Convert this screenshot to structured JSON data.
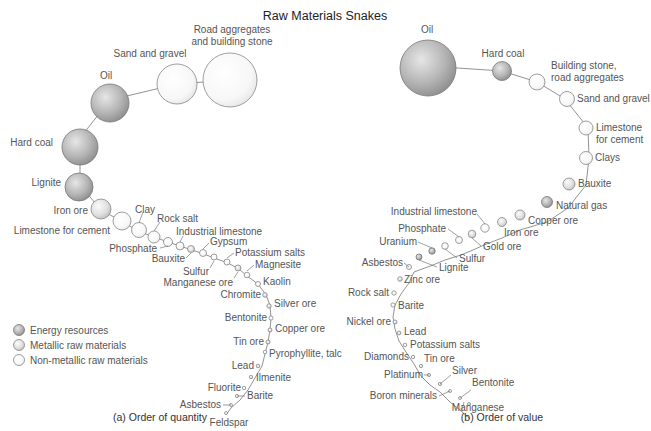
{
  "title": "Raw Materials Snakes",
  "legend": {
    "items": [
      {
        "label": "Energy resources",
        "category": "energy",
        "color": "#9a9a9a"
      },
      {
        "label": "Metallic raw materials",
        "category": "metallic",
        "color": "#d6d6d6"
      },
      {
        "label": "Non-metallic raw materials",
        "category": "nonmetallic",
        "color": "#f4f4f4"
      }
    ]
  },
  "panels": [
    {
      "caption": "(a) Order of quantity",
      "items": [
        {
          "label": "Road aggregates and building stone",
          "category": "nonmetallic"
        },
        {
          "label": "Sand and gravel",
          "category": "nonmetallic"
        },
        {
          "label": "Oil",
          "category": "energy"
        },
        {
          "label": "Hard coal",
          "category": "energy"
        },
        {
          "label": "Lignite",
          "category": "energy"
        },
        {
          "label": "Iron ore",
          "category": "metallic"
        },
        {
          "label": "Limestone for cement",
          "category": "nonmetallic"
        },
        {
          "label": "Clay",
          "category": "nonmetallic"
        },
        {
          "label": "Rock salt",
          "category": "nonmetallic"
        },
        {
          "label": "Phosphate",
          "category": "nonmetallic"
        },
        {
          "label": "Industrial limestone",
          "category": "nonmetallic"
        },
        {
          "label": "Bauxite",
          "category": "metallic"
        },
        {
          "label": "Gypsum",
          "category": "nonmetallic"
        },
        {
          "label": "Sulfur",
          "category": "nonmetallic"
        },
        {
          "label": "Potassium salts",
          "category": "nonmetallic"
        },
        {
          "label": "Manganese ore",
          "category": "metallic"
        },
        {
          "label": "Magnesite",
          "category": "nonmetallic"
        },
        {
          "label": "Kaolin",
          "category": "nonmetallic"
        },
        {
          "label": "Chromite",
          "category": "metallic"
        },
        {
          "label": "Silver ore",
          "category": "metallic"
        },
        {
          "label": "Bentonite",
          "category": "nonmetallic"
        },
        {
          "label": "Copper ore",
          "category": "metallic"
        },
        {
          "label": "Tin ore",
          "category": "metallic"
        },
        {
          "label": "Pyrophyllite, talc",
          "category": "nonmetallic"
        },
        {
          "label": "Lead",
          "category": "metallic"
        },
        {
          "label": "Ilmenite",
          "category": "metallic"
        },
        {
          "label": "Fluorite",
          "category": "nonmetallic"
        },
        {
          "label": "Barite",
          "category": "nonmetallic"
        },
        {
          "label": "Asbestos",
          "category": "nonmetallic"
        },
        {
          "label": "Feldspar",
          "category": "nonmetallic"
        }
      ]
    },
    {
      "caption": "(b) Order of value",
      "items": [
        {
          "label": "Oil",
          "category": "energy"
        },
        {
          "label": "Hard coal",
          "category": "energy"
        },
        {
          "label": "Building stone, road aggregates",
          "category": "nonmetallic"
        },
        {
          "label": "Sand and gravel",
          "category": "nonmetallic"
        },
        {
          "label": "Limestone for cement",
          "category": "nonmetallic"
        },
        {
          "label": "Clays",
          "category": "nonmetallic"
        },
        {
          "label": "Bauxite",
          "category": "metallic"
        },
        {
          "label": "Natural gas",
          "category": "energy"
        },
        {
          "label": "Copper ore",
          "category": "metallic"
        },
        {
          "label": "Iron ore",
          "category": "metallic"
        },
        {
          "label": "Industrial limestone",
          "category": "nonmetallic"
        },
        {
          "label": "Gold ore",
          "category": "metallic"
        },
        {
          "label": "Phosphate",
          "category": "nonmetallic"
        },
        {
          "label": "Sulfur",
          "category": "nonmetallic"
        },
        {
          "label": "Uranium",
          "category": "energy"
        },
        {
          "label": "Lignite",
          "category": "energy"
        },
        {
          "label": "Asbestos",
          "category": "nonmetallic"
        },
        {
          "label": "Zinc ore",
          "category": "metallic"
        },
        {
          "label": "Rock salt",
          "category": "nonmetallic"
        },
        {
          "label": "Barite",
          "category": "nonmetallic"
        },
        {
          "label": "Nickel ore",
          "category": "metallic"
        },
        {
          "label": "Lead",
          "category": "metallic"
        },
        {
          "label": "Potassium salts",
          "category": "nonmetallic"
        },
        {
          "label": "Diamonds",
          "category": "nonmetallic"
        },
        {
          "label": "Tin ore",
          "category": "metallic"
        },
        {
          "label": "Platinum",
          "category": "metallic"
        },
        {
          "label": "Silver",
          "category": "metallic"
        },
        {
          "label": "Boron minerals",
          "category": "nonmetallic"
        },
        {
          "label": "Bentonite",
          "category": "nonmetallic"
        },
        {
          "label": "Manganese",
          "category": "metallic"
        }
      ]
    }
  ],
  "labels_a": {
    "road1": "Road aggregates",
    "road2": "and building stone",
    "sand": "Sand and gravel",
    "oil": "Oil",
    "hardcoal": "Hard coal",
    "lignite": "Lignite",
    "iron": "Iron ore",
    "limestone": "Limestone for cement",
    "clay": "Clay",
    "rocksalt": "Rock salt",
    "phosphate": "Phosphate",
    "indlime": "Industrial limestone",
    "bauxite": "Bauxite",
    "gypsum": "Gypsum",
    "sulfur": "Sulfur",
    "potassium": "Potassium salts",
    "manganese": "Manganese ore",
    "magnesite": "Magnesite",
    "kaolin": "Kaolin",
    "chromite": "Chromite",
    "silver": "Silver ore",
    "bentonite": "Bentonite",
    "copper": "Copper ore",
    "tin": "Tin ore",
    "pyro": "Pyrophyllite, talc",
    "lead": "Lead",
    "ilmenite": "Ilmenite",
    "fluorite": "Fluorite",
    "barite": "Barite",
    "asbestos": "Asbestos",
    "feldspar": "Feldspar"
  },
  "labels_b": {
    "oil": "Oil",
    "hardcoal": "Hard coal",
    "building1": "Building stone,",
    "building2": "road aggregates",
    "sand": "Sand and gravel",
    "lime1": "Limestone",
    "lime2": "for cement",
    "clays": "Clays",
    "bauxite": "Bauxite",
    "natgas": "Natural gas",
    "copper": "Copper ore",
    "iron": "Iron ore",
    "indlime": "Industrial limestone",
    "gold": "Gold ore",
    "phosphate": "Phosphate",
    "sulfur": "Sulfur",
    "uranium": "Uranium",
    "lignite": "Lignite",
    "asbestos": "Asbestos",
    "zinc": "Zinc ore",
    "rocksalt": "Rock salt",
    "barite": "Barite",
    "nickel": "Nickel ore",
    "lead": "Lead",
    "potassium": "Potassium salts",
    "diamonds": "Diamonds",
    "tin": "Tin ore",
    "platinum": "Platinum",
    "silver": "Silver",
    "boron": "Boron minerals",
    "bentonite": "Bentonite",
    "manganese": "Manganese"
  }
}
